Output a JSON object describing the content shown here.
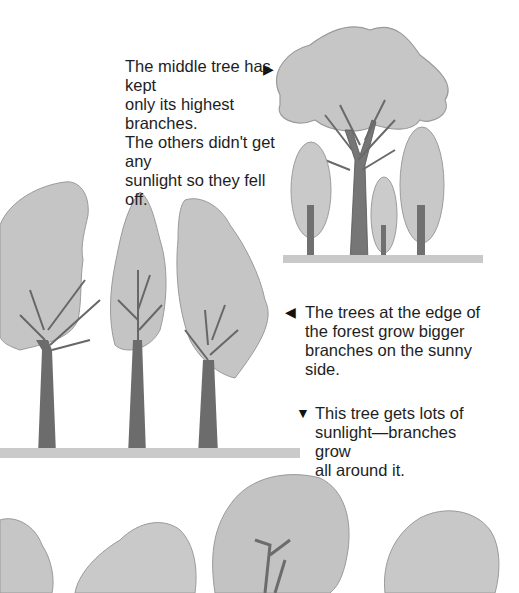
{
  "captions": {
    "forest_tree": {
      "text": "The middle tree has kept only its highest branches. The others didn't get any sunlight so they fell off.",
      "lines": [
        "The middle tree has kept",
        "only its highest branches.",
        "The others didn't get any",
        "sunlight so they fell off."
      ],
      "pointer": "▶",
      "pointer_icon": "arrow-right-icon"
    },
    "edge_trees": {
      "text": "The trees at the edge of the forest grow bigger branches on the sunny side.",
      "lines": [
        "The trees at the edge of",
        "the forest grow bigger",
        "branches on the sunny",
        "side."
      ],
      "pointer": "◀",
      "pointer_icon": "arrow-left-icon"
    },
    "open_tree": {
      "text": "This tree gets lots of sunlight—branches grow all around it.",
      "lines": [
        "This tree gets lots of",
        "sunlight—branches grow",
        "all around it."
      ],
      "pointer": "▼",
      "pointer_icon": "arrow-down-icon"
    }
  },
  "illustrations": {
    "forest_group": "Tall tree with crown at top surrounded by smaller trees",
    "edge_group": "Three trees at forest edge with branches on sunny side",
    "open_group": "Round-crowned trees growing in open sunlight"
  },
  "colors": {
    "foliage": "#c4c4c4",
    "foliage_dark": "#a9a9a9",
    "trunk": "#6e6e6e",
    "grass": "#b8b8b8",
    "text": "#1e1e1e"
  }
}
